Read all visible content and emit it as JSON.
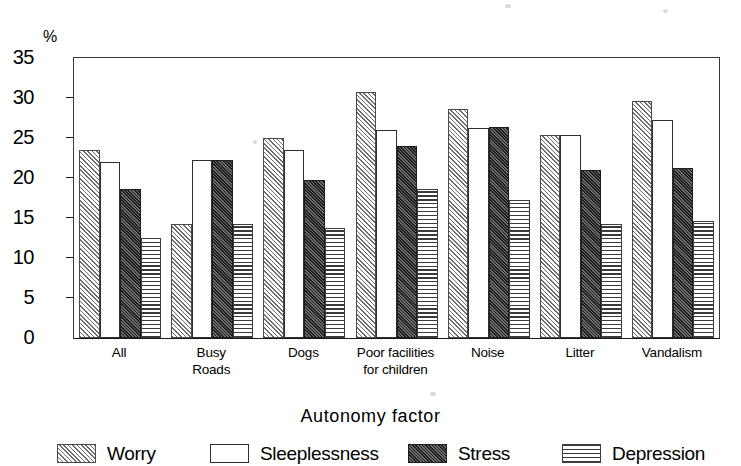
{
  "chart_data": {
    "type": "bar",
    "title": "",
    "xlabel": "Autonomy factor",
    "ylabel": "%",
    "ylim": [
      0,
      35
    ],
    "yticks": [
      0,
      5,
      10,
      15,
      20,
      25,
      30,
      35
    ],
    "ytick_labels": [
      "0",
      "5",
      "10",
      "15",
      "20",
      "25",
      "30",
      "35"
    ],
    "grid": false,
    "legend_position": "bottom",
    "categories": [
      "All",
      "Busy Roads",
      "Dogs",
      "Poor facilities for children",
      "Noise",
      "Litter",
      "Vandalism"
    ],
    "series": [
      {
        "name": "Worry",
        "pattern": "diagonal-hatch",
        "values": [
          23.5,
          14.2,
          25.0,
          30.8,
          28.6,
          25.4,
          29.6
        ]
      },
      {
        "name": "Sleeplessness",
        "pattern": "white-open",
        "values": [
          22.0,
          22.3,
          23.5,
          26.0,
          26.3,
          25.4,
          27.3
        ]
      },
      {
        "name": "Stress",
        "pattern": "dark-crosshatch",
        "values": [
          18.6,
          22.3,
          19.8,
          24.0,
          26.4,
          21.0,
          21.2
        ]
      },
      {
        "name": "Depression",
        "pattern": "horizontal-lines",
        "values": [
          12.5,
          14.2,
          13.8,
          18.6,
          17.2,
          14.2,
          14.6
        ]
      }
    ]
  },
  "axis": {
    "y_unit_label": "%",
    "x_title": "Autonomy factor"
  },
  "category_lines": [
    [
      "All"
    ],
    [
      "Busy",
      "Roads"
    ],
    [
      "Dogs"
    ],
    [
      "Poor facilities",
      "for children"
    ],
    [
      "Noise"
    ],
    [
      "Litter"
    ],
    [
      "Vandalism"
    ]
  ],
  "legend": {
    "items": [
      {
        "label": "Worry",
        "pattern": "diagonal-hatch"
      },
      {
        "label": "Sleeplessness",
        "pattern": "white-open"
      },
      {
        "label": "Stress",
        "pattern": "dark-crosshatch"
      },
      {
        "label": "Depression",
        "pattern": "horizontal-lines"
      }
    ]
  },
  "colors": {
    "axis": "#1a1a1a",
    "frame": "#3a3a3a",
    "hatch_line": "#6d6d6d",
    "dark_fill": "#1c1c1c",
    "hline": "#3a3a3a",
    "background": "#ffffff",
    "text": "#000000"
  }
}
